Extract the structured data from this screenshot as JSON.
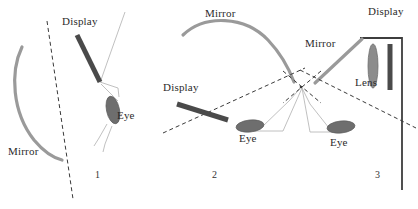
{
  "figure": {
    "width": 418,
    "height": 209,
    "background_color": "#ffffff"
  },
  "colors": {
    "mirror_gray": "#9a9a9a",
    "display_dark": "#4a4a4a",
    "eye_gray": "#6e6e6e",
    "lens_gray": "#8c8c8c",
    "ray_light": "#b9b9b9",
    "dashed_axis": "#3a3a3a",
    "frame_dark": "#3d3d3d",
    "text": "#2b2b2b"
  },
  "panels": [
    {
      "id": "panel-1",
      "number": "1",
      "number_pos": {
        "x": 95,
        "y": 178
      },
      "labels": [
        {
          "name": "display-label",
          "text": "Display",
          "x": 62,
          "y": 25
        },
        {
          "name": "eye-label",
          "text": "Eye",
          "x": 117,
          "y": 119
        },
        {
          "name": "mirror-label",
          "text": "Mirror",
          "x": 8,
          "y": 155
        }
      ],
      "components": {
        "mirror": {
          "name": "curved-mirror",
          "type": "arc",
          "path": "M 22,47 C 10,72 12,112 34,140 C 44,152 54,158 62,160"
        },
        "display": {
          "name": "display-bar",
          "type": "bar",
          "x1": 77,
          "y1": 35,
          "x2": 100,
          "y2": 82,
          "width": 5
        },
        "eye": {
          "name": "eye-ellipse",
          "type": "ellipse",
          "cx": 113,
          "cy": 110,
          "rx": 6.5,
          "ry": 14,
          "rotation": -12
        },
        "rays": [
          {
            "name": "ray-line-upper",
            "points": "125,12 108,60 101,80"
          },
          {
            "name": "ray-line-cone-top",
            "points": "100,82 118,88 119,97"
          },
          {
            "name": "ray-line-cone-lower",
            "points": "101,84 111,94 118,101"
          },
          {
            "name": "ray-line-lower-a",
            "points": "107,124 99,138 94,146"
          },
          {
            "name": "ray-line-lower-b",
            "points": "112,126 105,144 103,152"
          }
        ],
        "optical_axis": {
          "name": "optical-axis-dashed",
          "type": "dashed-line",
          "x1": 47,
          "y1": 21,
          "x2": 73,
          "y2": 199
        }
      }
    },
    {
      "id": "panel-2",
      "number": "2",
      "number_pos": {
        "x": 212,
        "y": 178
      },
      "labels": [
        {
          "name": "mirror-label",
          "text": "Mirror",
          "x": 205,
          "y": 17
        },
        {
          "name": "display-label",
          "text": "Display",
          "x": 163,
          "y": 91
        },
        {
          "name": "eye-label",
          "text": "Eye",
          "x": 239,
          "y": 142
        }
      ],
      "components": {
        "mirror": {
          "name": "curved-mirror",
          "type": "arc",
          "path": "M 183,35 C 205,14 245,16 268,40 C 285,58 291,74 294,82"
        },
        "display": {
          "name": "display-bar",
          "type": "bar",
          "x1": 177,
          "y1": 104,
          "x2": 228,
          "y2": 120,
          "width": 5
        },
        "eye": {
          "name": "eye-ellipse",
          "type": "ellipse",
          "cx": 250,
          "cy": 126,
          "rx": 14,
          "ry": 6,
          "rotation": -6
        },
        "rays": [
          {
            "name": "ray-line-left-up",
            "points": "262,127 290,100 302,86"
          },
          {
            "name": "ray-line-left-base",
            "points": "253,131 283,131"
          },
          {
            "name": "ray-line-apex-left",
            "points": "283,131 302,88"
          }
        ],
        "optical_axis": {
          "name": "optical-axis-dashed",
          "type": "dashed-line",
          "x1": 163,
          "y1": 133,
          "x2": 305,
          "y2": 68
        }
      }
    },
    {
      "id": "panel-3",
      "number": "3",
      "number_pos": {
        "x": 375,
        "y": 178
      },
      "labels": [
        {
          "name": "mirror-label",
          "text": "Mirror",
          "x": 305,
          "y": 47
        },
        {
          "name": "display-label",
          "text": "Display",
          "x": 368,
          "y": 15
        },
        {
          "name": "lens-label",
          "text": "Lens",
          "x": 355,
          "y": 86
        },
        {
          "name": "eye-label",
          "text": "Eye",
          "x": 330,
          "y": 146
        }
      ],
      "components": {
        "mirror": {
          "name": "flat-mirror",
          "type": "line",
          "x1": 315,
          "y1": 83,
          "x2": 362,
          "y2": 39
        },
        "display": {
          "name": "display-bar",
          "type": "vertical-bar",
          "x": 390,
          "y1": 44,
          "y2": 90,
          "width": 5
        },
        "lens": {
          "name": "lens-shape",
          "type": "lens",
          "cx": 373,
          "cy": 66,
          "rx": 5,
          "ry": 22
        },
        "frame": {
          "name": "housing-frame",
          "type": "polyline",
          "points": "360,38 402,38 402,190"
        },
        "eye": {
          "name": "eye-ellipse",
          "type": "ellipse",
          "cx": 341,
          "cy": 127,
          "rx": 14,
          "ry": 6,
          "rotation": -6
        },
        "rays": [
          {
            "name": "ray-line-right-up",
            "points": "329,128 310,104 302,88"
          },
          {
            "name": "ray-line-right-base",
            "points": "338,132 310,132"
          },
          {
            "name": "ray-line-apex-right",
            "points": "310,132 302,88"
          }
        ],
        "optical_axis": {
          "name": "optical-axis-dashed",
          "type": "dashed-line",
          "x1": 300,
          "y1": 70,
          "x2": 416,
          "y2": 128
        }
      }
    }
  ],
  "shared": {
    "crossing_point": {
      "name": "ray-crossing-point",
      "x": 301,
      "y": 87
    },
    "crossing_dashes": [
      {
        "name": "cross-dash-ne",
        "x1": 283,
        "y1": 71,
        "x2": 321,
        "y2": 103
      },
      {
        "name": "cross-dash-nw",
        "x1": 321,
        "y1": 71,
        "x2": 283,
        "y2": 103
      }
    ]
  }
}
